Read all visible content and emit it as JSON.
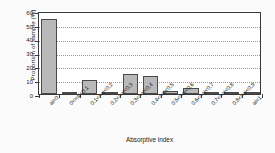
{
  "chart_data": {
    "type": "bar",
    "title": "",
    "xlabel": "Absorptive index",
    "ylabel": "Proportion of sample (%)",
    "categories": [
      "ai=0",
      "0<=ai<0.1",
      "0.1<=ai<0.2",
      "0.2<=ai<0.3",
      "0.3<=ai<0.4",
      "0.4<=ai<0.5",
      "0.5<=ai<0.6",
      "0.6<=ai<0.7",
      "0.7<=ai<0.8",
      "0.8<=ai<0.9",
      "ai=1"
    ],
    "values": [
      54.5,
      0.5,
      10.2,
      1.0,
      14.8,
      13.2,
      2.5,
      4.0,
      0.5,
      0.5,
      0.5
    ],
    "ylim": [
      0,
      60
    ],
    "yticks": [
      0,
      10,
      20,
      30,
      40,
      50,
      60
    ],
    "ytick_labels": [
      "0",
      "10",
      "20",
      "30",
      "40",
      "50",
      "60"
    ],
    "grid": true,
    "grid_axis": "y",
    "grid_style": "dotted",
    "legend": false,
    "bar_fill_color": "#b9b9b9",
    "bar_edge_color": "#4a4a4a",
    "axis_color": "#3a3a3a",
    "background_color": "#ffffff"
  }
}
